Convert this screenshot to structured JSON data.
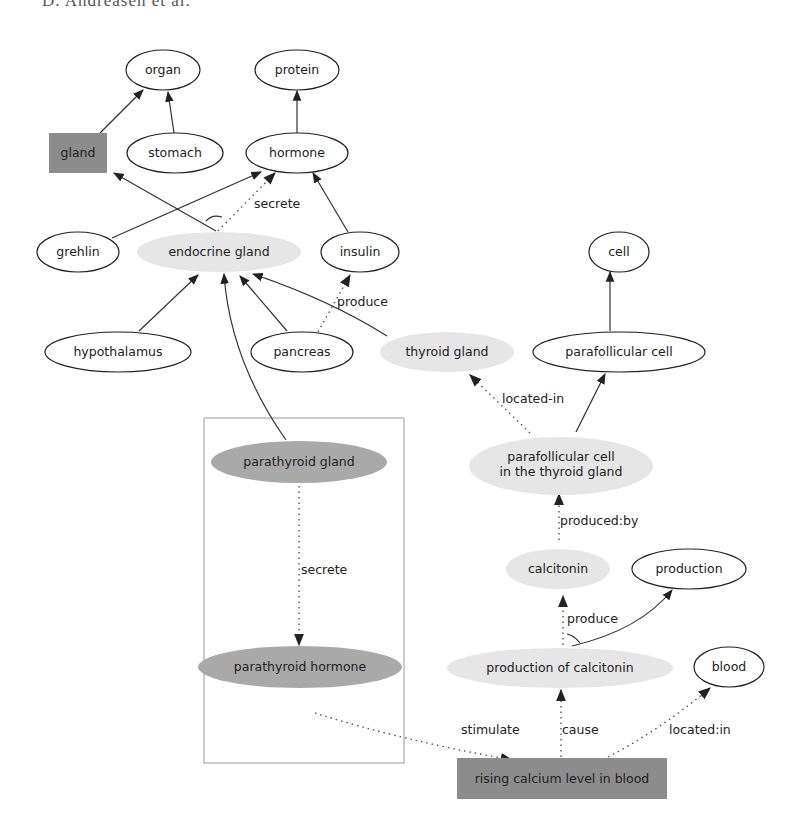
{
  "header": {
    "text": "D. Andreasen et al."
  },
  "colors": {
    "light_node": "#e6e6e6",
    "dark_node": "#a9a9a9",
    "box_node": "#8c8c8c",
    "stroke": "#222222",
    "frame": "#999999"
  },
  "nodes": {
    "organ": "organ",
    "protein": "protein",
    "gland": "gland",
    "stomach": "stomach",
    "hormone": "hormone",
    "grehlin": "grehlin",
    "endocrine_gland": "endocrine gland",
    "insulin": "insulin",
    "cell": "cell",
    "hypothalamus": "hypothalamus",
    "pancreas": "pancreas",
    "thyroid_gland": "thyroid gland",
    "parafollicular_cell": "parafollicular cell",
    "parathyroid_gland": "parathyroid gland",
    "pc_thyroid_1": "parafollicular cell",
    "pc_thyroid_2": "in the thyroid gland",
    "calcitonin": "calcitonin",
    "production": "production",
    "parathyroid_hormone": "parathyroid hormone",
    "production_of_calcitonin": "production of calcitonin",
    "blood": "blood",
    "rising_calcium": "rising calcium level in blood"
  },
  "edge_labels": {
    "secrete_top": "secrete",
    "produce_insulin": "produce",
    "located_in": "located-in",
    "secrete_para": "secrete",
    "produced_by": "produced:by",
    "produce_calc": "produce",
    "stimulate": "stimulate",
    "cause": "cause",
    "located_in_blood": "located:in"
  }
}
